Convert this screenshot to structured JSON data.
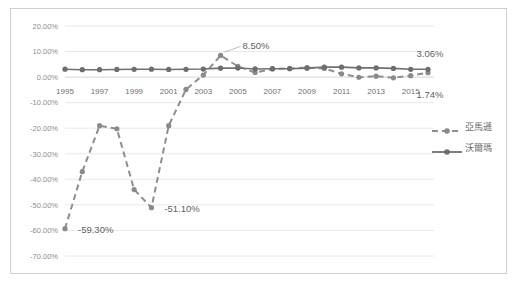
{
  "chart_title": "亞馬遜與沃爾瑪淨利率",
  "legend": {
    "position": "right",
    "items": [
      {
        "name": "amazon",
        "label": "亞馬遜",
        "style": "dashed",
        "color": "#8e8e8e"
      },
      {
        "name": "walmart",
        "label": "沃爾瑪",
        "style": "solid",
        "color": "#707070"
      }
    ]
  },
  "axes": {
    "y_ticks": [
      "20.00%",
      "10.00%",
      "0.00%",
      "-10.00%",
      "-20.00%",
      "-30.00%",
      "-40.00%",
      "-50.00%",
      "-60.00%",
      "-70.00%"
    ],
    "x_ticks": [
      "1995",
      "1997",
      "1999",
      "2001",
      "2003",
      "2005",
      "2007",
      "2009",
      "2011",
      "2013",
      "2015"
    ]
  },
  "annotations": [
    {
      "name": "amazon-start-label",
      "text": "-59.30%"
    },
    {
      "name": "amazon-trough-label",
      "text": "-51.10%"
    },
    {
      "name": "amazon-peak-label",
      "text": "8.50%"
    },
    {
      "name": "walmart-end-label",
      "text": "3.06%"
    },
    {
      "name": "amazon-end-label",
      "text": "1.74%"
    }
  ],
  "colors": {
    "amazon": "#8e8e8e",
    "walmart": "#707070",
    "gridline": "#e2e2e2",
    "frame": "#cfcfcf",
    "text": "#6f6f6f"
  },
  "chart_data": {
    "type": "line",
    "title": "亞馬遜與沃爾瑪淨利率",
    "xlabel": "",
    "ylabel": "",
    "ylim": [
      -0.7,
      0.2
    ],
    "ytick_step": 0.1,
    "grid": true,
    "legend_position": "right",
    "x": [
      1995,
      1996,
      1997,
      1998,
      1999,
      2000,
      2001,
      2002,
      2003,
      2004,
      2005,
      2006,
      2007,
      2008,
      2009,
      2010,
      2011,
      2012,
      2013,
      2014,
      2015,
      2016
    ],
    "categories": [
      "1995",
      "1996",
      "1997",
      "1998",
      "1999",
      "2000",
      "2001",
      "2002",
      "2003",
      "2004",
      "2005",
      "2006",
      "2007",
      "2008",
      "2009",
      "2010",
      "2011",
      "2012",
      "2013",
      "2014",
      "2015",
      "2016"
    ],
    "series": [
      {
        "name": "亞馬遜",
        "key": "amazon",
        "style": "dashed",
        "values": [
          -59.3,
          -37.0,
          -19.0,
          -20.2,
          -44.0,
          -51.1,
          -19.0,
          -4.8,
          0.8,
          8.5,
          4.2,
          1.8,
          3.2,
          3.4,
          3.7,
          3.4,
          1.3,
          -0.06,
          0.37,
          -0.27,
          0.56,
          1.74
        ],
        "labeled_points": [
          {
            "x": 1995,
            "y": -59.3,
            "text": "-59.30%"
          },
          {
            "x": 2000,
            "y": -51.1,
            "text": "-51.10%"
          },
          {
            "x": 2004,
            "y": 8.5,
            "text": "8.50%"
          },
          {
            "x": 2016,
            "y": 1.74,
            "text": "1.74%"
          }
        ]
      },
      {
        "name": "沃爾瑪",
        "key": "walmart",
        "style": "solid",
        "values": [
          3.1,
          2.9,
          2.9,
          3.0,
          3.05,
          3.1,
          3.0,
          3.05,
          3.15,
          3.5,
          3.55,
          3.2,
          3.3,
          3.3,
          3.5,
          3.9,
          3.9,
          3.6,
          3.6,
          3.4,
          3.05,
          3.06
        ],
        "labeled_points": [
          {
            "x": 2016,
            "y": 3.06,
            "text": "3.06%"
          }
        ]
      }
    ]
  }
}
